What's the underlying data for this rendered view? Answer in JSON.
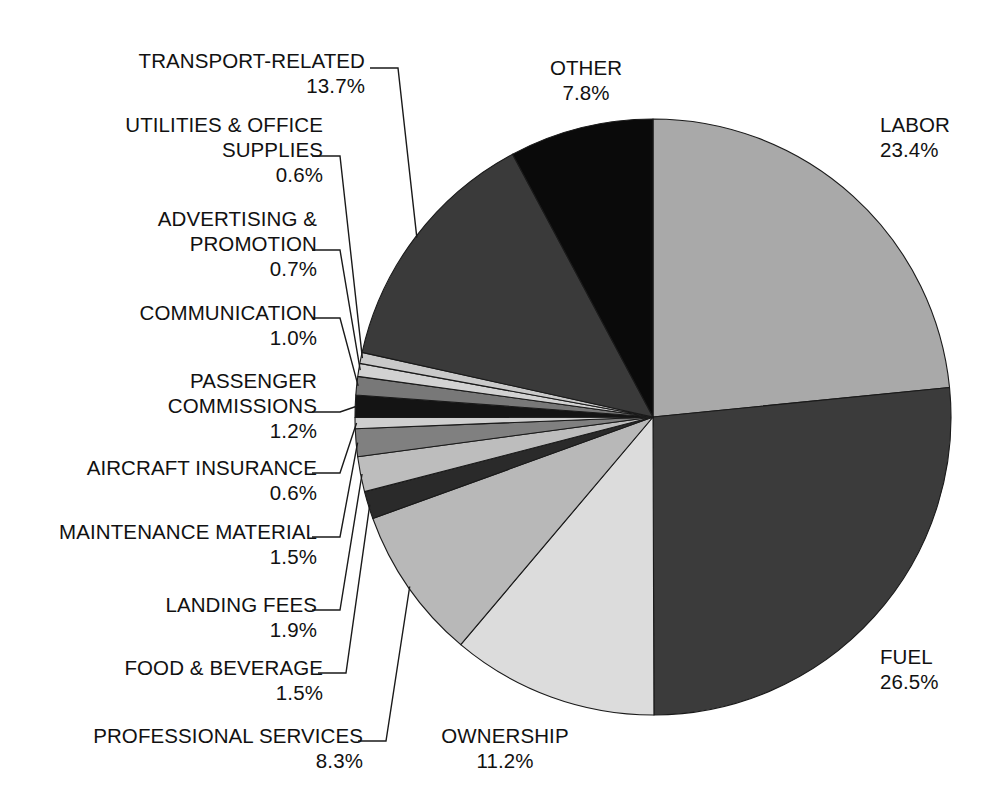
{
  "chart_data": {
    "type": "pie",
    "title": "",
    "subtitle": "",
    "xlabel": "",
    "ylabel": "",
    "legend_position": "none",
    "grid": false,
    "value_unit": "percent",
    "total": 100.0,
    "start_angle_deg": -90,
    "direction": "clockwise",
    "categories": [
      "LABOR",
      "FUEL",
      "OWNERSHIP",
      "PROFESSIONAL SERVICES",
      "FOOD & BEVERAGE",
      "LANDING FEES",
      "MAINTENANCE MATERIAL",
      "AIRCRAFT INSURANCE",
      "PASSENGER COMMISSIONS",
      "COMMUNICATION",
      "ADVERTISING & PROMOTION",
      "UTILITIES & OFFICE SUPPLIES",
      "TRANSPORT-RELATED",
      "OTHER"
    ],
    "values": [
      23.4,
      26.5,
      11.2,
      8.3,
      1.5,
      1.9,
      1.5,
      0.6,
      1.2,
      1.0,
      0.7,
      0.6,
      13.7,
      7.8
    ],
    "value_labels": [
      "23.4%",
      "26.5%",
      "11.2%",
      "8.3%",
      "1.5%",
      "1.9%",
      "1.5%",
      "0.6%",
      "1.2%",
      "1.0%",
      "0.7%",
      "0.6%",
      "13.7%",
      "7.8%"
    ],
    "colors": [
      "#a9a9a9",
      "#3b3b3b",
      "#dcdcdc",
      "#b8b8b8",
      "#2a2a2a",
      "#bdbdbd",
      "#808080",
      "#cfcfcf",
      "#141414",
      "#787878",
      "#d2d2d2",
      "#c9c9c9",
      "#3a3a3a",
      "#0a0a0a"
    ],
    "slices": [
      {
        "label": "LABOR",
        "value": 23.4,
        "value_label": "23.4%",
        "color": "#a9a9a9"
      },
      {
        "label": "FUEL",
        "value": 26.5,
        "value_label": "26.5%",
        "color": "#3b3b3b"
      },
      {
        "label": "OWNERSHIP",
        "value": 11.2,
        "value_label": "11.2%",
        "color": "#dcdcdc"
      },
      {
        "label": "PROFESSIONAL SERVICES",
        "value": 8.3,
        "value_label": "8.3%",
        "color": "#b8b8b8"
      },
      {
        "label": "FOOD & BEVERAGE",
        "value": 1.5,
        "value_label": "1.5%",
        "color": "#2a2a2a"
      },
      {
        "label": "LANDING FEES",
        "value": 1.9,
        "value_label": "1.9%",
        "color": "#bdbdbd"
      },
      {
        "label": "MAINTENANCE MATERIAL",
        "value": 1.5,
        "value_label": "1.5%",
        "color": "#808080"
      },
      {
        "label": "AIRCRAFT INSURANCE",
        "value": 0.6,
        "value_label": "0.6%",
        "color": "#cfcfcf"
      },
      {
        "label": "PASSENGER COMMISSIONS",
        "value": 1.2,
        "value_label": "1.2%",
        "color": "#141414"
      },
      {
        "label": "COMMUNICATION",
        "value": 1.0,
        "value_label": "1.0%",
        "color": "#787878"
      },
      {
        "label": "ADVERTISING & PROMOTION",
        "value": 0.7,
        "value_label": "0.7%",
        "color": "#d2d2d2"
      },
      {
        "label": "UTILITIES & OFFICE SUPPLIES",
        "value": 0.6,
        "value_label": "0.6%",
        "color": "#c9c9c9"
      },
      {
        "label": "TRANSPORT-RELATED",
        "value": 13.7,
        "value_label": "13.7%",
        "color": "#3a3a3a"
      },
      {
        "label": "OTHER",
        "value": 7.8,
        "value_label": "7.8%",
        "color": "#0a0a0a"
      }
    ]
  },
  "geometry": {
    "center_x": 653,
    "center_y": 417,
    "radius": 298
  },
  "labels": {
    "labor": {
      "name": "LABOR",
      "pct": "23.4%"
    },
    "fuel": {
      "name": "FUEL",
      "pct": "26.5%"
    },
    "other": {
      "name": "OTHER",
      "pct": "7.8%"
    },
    "ownership": {
      "name": "OWNERSHIP",
      "pct": "11.2%"
    },
    "transport": {
      "name": "TRANSPORT-RELATED",
      "pct": "13.7%"
    },
    "utilities": {
      "name": "UTILITIES & OFFICE\nSUPPLIES",
      "pct": "0.6%"
    },
    "advertising": {
      "name": "ADVERTISING &\nPROMOTION",
      "pct": "0.7%"
    },
    "communication": {
      "name": "COMMUNICATION",
      "pct": "1.0%"
    },
    "passenger": {
      "name": "PASSENGER\nCOMMISSIONS",
      "pct": "1.2%"
    },
    "insurance": {
      "name": "AIRCRAFT INSURANCE",
      "pct": "0.6%"
    },
    "maintenance": {
      "name": "MAINTENANCE MATERIAL",
      "pct": "1.5%"
    },
    "landing": {
      "name": "LANDING FEES",
      "pct": "1.9%"
    },
    "food": {
      "name": "FOOD & BEVERAGE",
      "pct": "1.5%"
    },
    "professional": {
      "name": "PROFESSIONAL SERVICES",
      "pct": "8.3%"
    }
  },
  "style": {
    "background": "#ffffff",
    "text_color": "#111111",
    "slice_outline": "#1a1a1a",
    "leader_color": "#1a1a1a"
  }
}
